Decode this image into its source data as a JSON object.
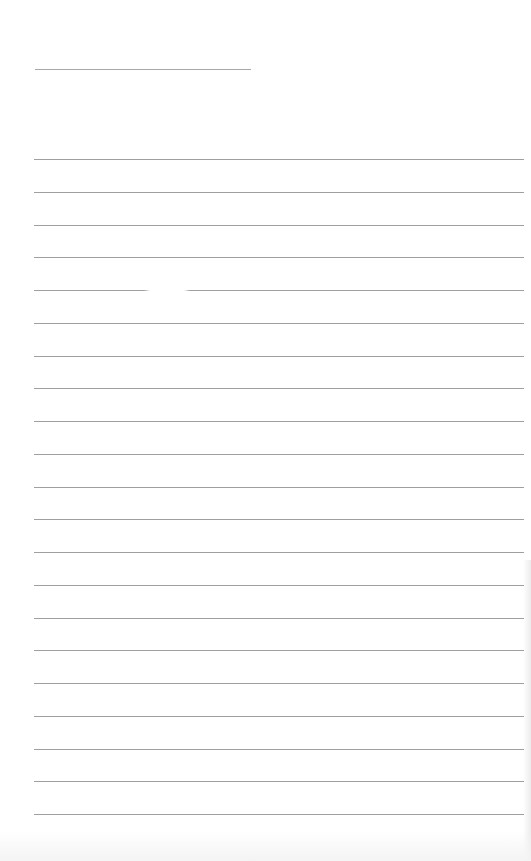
{
  "document": {
    "type": "lined-notepad-page",
    "header_line": {
      "y": 69,
      "x": 35,
      "width": 216,
      "label": ""
    },
    "ruled_lines": {
      "count": 21,
      "first_y": 159,
      "spacing": 32.75,
      "color": "#9f9f9f",
      "lines": [
        {
          "text": ""
        },
        {
          "text": ""
        },
        {
          "text": ""
        },
        {
          "text": ""
        },
        {
          "text": ""
        },
        {
          "text": ""
        },
        {
          "text": ""
        },
        {
          "text": ""
        },
        {
          "text": ""
        },
        {
          "text": ""
        },
        {
          "text": ""
        },
        {
          "text": ""
        },
        {
          "text": ""
        },
        {
          "text": ""
        },
        {
          "text": ""
        },
        {
          "text": ""
        },
        {
          "text": ""
        },
        {
          "text": ""
        },
        {
          "text": ""
        },
        {
          "text": ""
        },
        {
          "text": ""
        }
      ]
    },
    "background_color": "#ffffff"
  }
}
